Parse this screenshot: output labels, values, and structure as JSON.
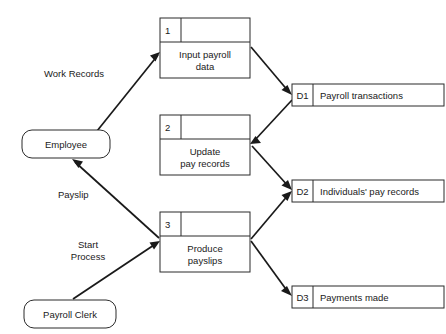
{
  "diagram": {
    "type": "data-flow-diagram",
    "external_entities": [
      {
        "id": "employee",
        "label": "Employee"
      },
      {
        "id": "payroll-clerk",
        "label": "Payroll Clerk"
      }
    ],
    "processes": [
      {
        "id": "p1",
        "number": "1",
        "line1": "Input payroll",
        "line2": "data"
      },
      {
        "id": "p2",
        "number": "2",
        "line1": "Update",
        "line2": "pay records"
      },
      {
        "id": "p3",
        "number": "3",
        "line1": "Produce",
        "line2": "payslips"
      }
    ],
    "data_stores": [
      {
        "id": "d1",
        "code": "D1",
        "label": "Payroll transactions"
      },
      {
        "id": "d2",
        "code": "D2",
        "label": "Individuals' pay records"
      },
      {
        "id": "d3",
        "code": "D3",
        "label": "Payments made"
      }
    ],
    "flows": [
      {
        "id": "f1",
        "label": "Work Records",
        "from": "employee",
        "to": "p1"
      },
      {
        "id": "f2",
        "label": "Payslip",
        "from": "p3",
        "to": "employee"
      },
      {
        "id": "f3",
        "label_line1": "Start",
        "label_line2": "Process",
        "from": "payroll-clerk",
        "to": "p3"
      },
      {
        "id": "f4",
        "label": "",
        "from": "p1",
        "to": "d1"
      },
      {
        "id": "f5",
        "label": "",
        "from": "d1",
        "to": "p2"
      },
      {
        "id": "f6",
        "label": "",
        "from": "p2",
        "to": "d2"
      },
      {
        "id": "f7",
        "label": "",
        "from": "p3",
        "to": "d2"
      },
      {
        "id": "f8",
        "label": "",
        "from": "p3",
        "to": "d3"
      }
    ],
    "colors": {
      "stroke": "#2b2b2b",
      "flow": "#1a1a1a",
      "fill": "#ffffff",
      "background": "#ffffff"
    }
  }
}
